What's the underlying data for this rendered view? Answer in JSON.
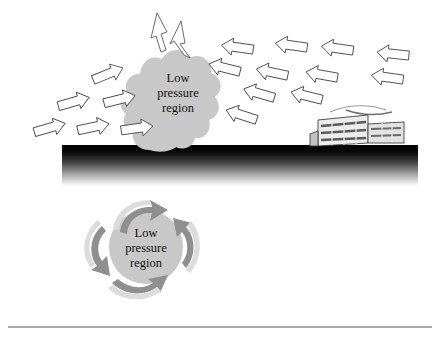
{
  "figure": {
    "background_color": "#ffffff",
    "width": 440,
    "height": 343
  },
  "colors": {
    "blob_fill": "#c8c8c8",
    "blob_fill_light": "#d2d2d2",
    "arrow_outline_fill": "#ffffff",
    "arrow_outline_stroke": "#4a4a4a",
    "spiral_arrow_dark": "#8f8f8f",
    "spiral_arrow_light": "#d8d8d8",
    "ground_top": "#000000",
    "ground_bottom": "#ffffff",
    "building_fill": "#e8e8e8",
    "building_stroke": "#3a3a3a",
    "rule_color": "#555555",
    "text_color": "#111111"
  },
  "upper_scene": {
    "name": "surface level convergence",
    "blob": {
      "label_lines": [
        "Low",
        "pressure",
        "region"
      ],
      "shape": "cloud",
      "center_x": 178,
      "center_y": 92
    },
    "outflow_arrows": [
      {
        "id": "up-left",
        "direction": "up",
        "angle_deg": -78
      },
      {
        "id": "up-right",
        "direction": "up-right",
        "angle_deg": -55
      }
    ],
    "inflow_arrows_left": [
      {
        "id": "l1",
        "x": 36,
        "y": 128,
        "angle_deg": -18
      },
      {
        "id": "l2",
        "x": 74,
        "y": 124,
        "angle_deg": -14
      },
      {
        "id": "l3",
        "x": 118,
        "y": 125,
        "angle_deg": -8
      },
      {
        "id": "l4",
        "x": 62,
        "y": 102,
        "angle_deg": -16
      },
      {
        "id": "l5",
        "x": 104,
        "y": 99,
        "angle_deg": -16
      },
      {
        "id": "l6",
        "x": 96,
        "y": 77,
        "angle_deg": -22
      }
    ],
    "inflow_arrows_right": [
      {
        "id": "r1",
        "x": 232,
        "y": 66,
        "angle_deg": 170
      },
      {
        "id": "r2",
        "x": 284,
        "y": 63,
        "angle_deg": 172
      },
      {
        "id": "r3",
        "x": 328,
        "y": 66,
        "angle_deg": 172
      },
      {
        "id": "r4",
        "x": 384,
        "y": 71,
        "angle_deg": 176
      },
      {
        "id": "r5",
        "x": 216,
        "y": 86,
        "angle_deg": 166
      },
      {
        "id": "r6",
        "x": 262,
        "y": 90,
        "angle_deg": 168
      },
      {
        "id": "r7",
        "x": 312,
        "y": 92,
        "angle_deg": 170
      },
      {
        "id": "r8",
        "x": 378,
        "y": 95,
        "angle_deg": 172
      },
      {
        "id": "r9",
        "x": 248,
        "y": 112,
        "angle_deg": 164
      },
      {
        "id": "r10",
        "x": 296,
        "y": 115,
        "angle_deg": 166
      },
      {
        "id": "r11",
        "x": 230,
        "y": 133,
        "angle_deg": 162
      }
    ]
  },
  "ground": {
    "name": "ground cross-section band",
    "x": 62,
    "y": 145,
    "width": 356,
    "height": 41
  },
  "building": {
    "name": "office building",
    "stories": 3,
    "x": 318,
    "y": 116,
    "width": 92,
    "height": 30
  },
  "lower_scene": {
    "name": "cyclonic rotation below ground",
    "blob": {
      "label_lines": [
        "Low",
        "pressure",
        "region"
      ],
      "shape": "circle",
      "center_x": 146,
      "center_y": 247,
      "radius": 37
    },
    "spiral_arrows": [
      {
        "id": "s-top",
        "position": "top",
        "rotation": "counter-clockwise"
      },
      {
        "id": "s-left",
        "position": "left",
        "rotation": "counter-clockwise"
      },
      {
        "id": "s-bottom",
        "position": "bottom",
        "rotation": "counter-clockwise"
      },
      {
        "id": "s-right",
        "position": "right",
        "rotation": "counter-clockwise"
      }
    ]
  },
  "footer_rule": {
    "name": "horizontal rule",
    "y": 327
  }
}
